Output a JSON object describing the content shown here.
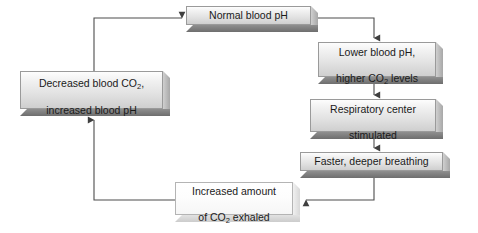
{
  "diagram": {
    "background_color": "#ffffff",
    "box_face_color": "#e8e8e8",
    "box_shadow_color": "#7a7a7a",
    "line_color": "#4d4d4d",
    "text_color": "#1a1a1a",
    "nodes": [
      {
        "id": "normal-blood-ph",
        "text": "Normal blood pH",
        "style": "shaded",
        "x": 186,
        "y": 6,
        "w": 132,
        "h": 26
      },
      {
        "id": "lower-blood-ph",
        "text_line1": "Lower blood pH,",
        "text_line2_pre": "higher CO",
        "text_line2_sub": "2",
        "text_line2_post": " levels",
        "text": "Lower blood pH, higher CO2 levels",
        "style": "shaded",
        "x": 318,
        "y": 42,
        "w": 125,
        "h": 42
      },
      {
        "id": "respiratory-center",
        "text_line1": "Respiratory center",
        "text_line2": "stimulated",
        "text": "Respiratory center stimulated",
        "style": "shaded",
        "x": 310,
        "y": 99,
        "w": 133,
        "h": 40
      },
      {
        "id": "faster-deeper-breathing",
        "text": "Faster, deeper breathing",
        "style": "shaded",
        "x": 300,
        "y": 152,
        "w": 150,
        "h": 26
      },
      {
        "id": "increased-co2-exhaled",
        "text_line1": "Increased amount",
        "text_line2_pre": "of CO",
        "text_line2_sub": "2",
        "text_line2_post": " exhaled",
        "text": "Increased amount of CO2 exhaled",
        "style": "light",
        "x": 175,
        "y": 182,
        "w": 125,
        "h": 40
      },
      {
        "id": "decreased-blood-co2",
        "text_line1_pre": "Decreased blood CO",
        "text_line1_sub": "2",
        "text_line1_post": ",",
        "text_line2": "increased blood pH",
        "text": "Decreased blood CO2, increased blood pH",
        "style": "shaded",
        "x": 20,
        "y": 71,
        "w": 150,
        "h": 45
      }
    ],
    "connectors": [
      {
        "id": "normal-to-lower",
        "from": "normal-blood-ph",
        "to": "lower-blood-ph",
        "arrow": "down"
      },
      {
        "id": "lower-to-respiratory",
        "from": "lower-blood-ph",
        "to": "respiratory-center",
        "arrow": "down"
      },
      {
        "id": "respiratory-to-breathing",
        "from": "respiratory-center",
        "to": "faster-deeper-breathing",
        "arrow": "down"
      },
      {
        "id": "breathing-to-exhaled",
        "from": "faster-deeper-breathing",
        "to": "increased-co2-exhaled",
        "arrow": "left"
      },
      {
        "id": "exhaled-to-decreased",
        "from": "increased-co2-exhaled",
        "to": "decreased-blood-co2",
        "arrow": "up"
      },
      {
        "id": "decreased-to-normal",
        "from": "decreased-blood-co2",
        "to": "normal-blood-ph",
        "arrow": "right"
      }
    ]
  }
}
